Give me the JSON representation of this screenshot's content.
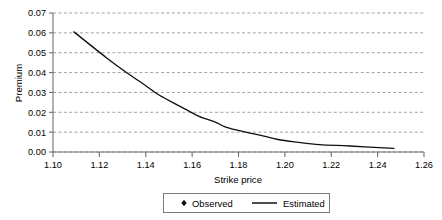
{
  "chart_data": {
    "type": "line",
    "title": "",
    "xlabel": "Strike price",
    "ylabel": "Premium",
    "xlim": [
      1.1,
      1.26
    ],
    "ylim": [
      0.0,
      0.07
    ],
    "xticks": [
      1.1,
      1.12,
      1.14,
      1.16,
      1.18,
      1.2,
      1.22,
      1.24,
      1.26
    ],
    "yticks": [
      0.0,
      0.01,
      0.02,
      0.03,
      0.04,
      0.05,
      0.06,
      0.07
    ],
    "xtick_labels": [
      "1.10",
      "1.12",
      "1.14",
      "1.16",
      "1.18",
      "1.20",
      "1.22",
      "1.24",
      "1.26"
    ],
    "ytick_labels": [
      "0.00",
      "0.01",
      "0.02",
      "0.03",
      "0.04",
      "0.05",
      "0.06",
      "0.07"
    ],
    "grid": "horizontal-dashed",
    "legend_position": "bottom-center",
    "series": [
      {
        "name": "Observed",
        "marker": "diamond",
        "color": "#111111",
        "x": [
          1.109,
          1.123,
          1.132,
          1.14,
          1.145,
          1.148,
          1.156,
          1.158,
          1.163,
          1.17,
          1.174,
          1.179,
          1.185,
          1.191,
          1.197,
          1.205,
          1.215,
          1.228,
          1.247
        ],
        "values": [
          0.0605,
          0.0475,
          0.0398,
          0.0334,
          0.0292,
          0.0272,
          0.0222,
          0.021,
          0.018,
          0.015,
          0.0128,
          0.0111,
          0.0095,
          0.008,
          0.0063,
          0.005,
          0.0037,
          0.003,
          0.0018
        ]
      },
      {
        "name": "Estimated",
        "marker": "none",
        "color": "#111111",
        "x": [
          1.109,
          1.123,
          1.132,
          1.14,
          1.145,
          1.148,
          1.156,
          1.158,
          1.163,
          1.17,
          1.174,
          1.179,
          1.185,
          1.191,
          1.197,
          1.205,
          1.215,
          1.228,
          1.247
        ],
        "values": [
          0.0605,
          0.0475,
          0.0398,
          0.0334,
          0.0292,
          0.0272,
          0.0222,
          0.021,
          0.018,
          0.015,
          0.0128,
          0.0111,
          0.0095,
          0.008,
          0.0063,
          0.005,
          0.0037,
          0.003,
          0.0018
        ]
      }
    ],
    "legend": [
      {
        "label": "Observed",
        "type": "marker"
      },
      {
        "label": "Estimated",
        "type": "line"
      }
    ]
  },
  "axes": {
    "x_title": "Strike price",
    "y_title": "Premium"
  },
  "legend": {
    "observed_label": "Observed",
    "estimated_label": "Estimated"
  },
  "colors": {
    "series": "#111111",
    "grid": "#8a8a8a",
    "axis": "#6f6f6f",
    "background": "#ffffff"
  }
}
